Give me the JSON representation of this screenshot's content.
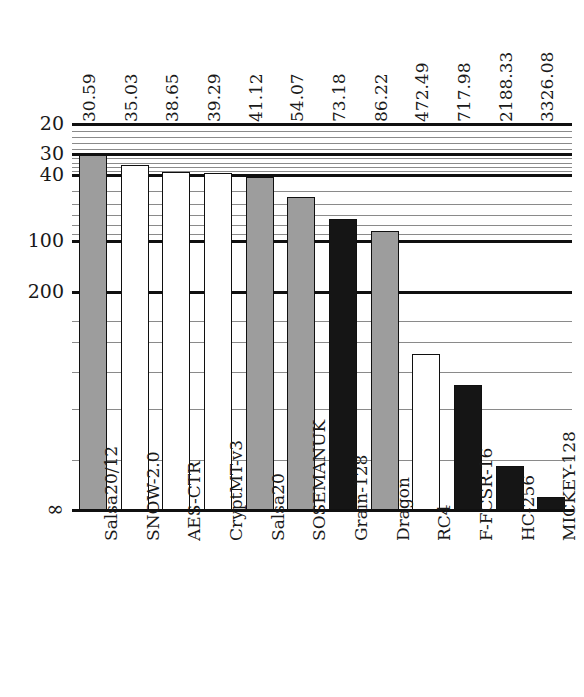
{
  "chart_data": {
    "type": "bar",
    "title": "",
    "subtitle": "",
    "xlabel": "",
    "ylabel": "",
    "categories": [
      "Salsa20/12",
      "SNOW-2.0",
      "AES-CTR",
      "CryptMT-v3",
      "Salsa20",
      "SOSEMANUK",
      "Grain-128",
      "Dragon",
      "RC4",
      "F-FCSR-16",
      "HC-256",
      "MICKEY-128"
    ],
    "values": [
      30.59,
      35.03,
      38.65,
      39.29,
      41.12,
      54.07,
      73.18,
      86.22,
      472.49,
      717.98,
      2188.33,
      3326.08
    ],
    "value_labels": [
      "30.59",
      "35.03",
      "38.65",
      "39.29",
      "41.12",
      "54.07",
      "73.18",
      "86.22",
      "472.49",
      "717.98",
      "2188.33",
      "3326.08"
    ],
    "bar_fills": [
      "gray",
      "white",
      "white",
      "white",
      "gray",
      "gray",
      "black",
      "gray",
      "white",
      "black",
      "black",
      "black"
    ],
    "scale": "log-inverted",
    "axis_direction": "values increase downward",
    "ylim": [
      20,
      4000
    ],
    "y_tick_labels": [
      "20",
      "30",
      "40",
      "100",
      "200",
      "∞"
    ],
    "y_tick_values": [
      20,
      30,
      40,
      100,
      200,
      4000
    ],
    "y_minor_tick_values": [
      22,
      24,
      26,
      28,
      32,
      34,
      36,
      38,
      50,
      60,
      70,
      80,
      90,
      300,
      400,
      600,
      1000,
      2000
    ],
    "grid": true,
    "legend": null,
    "colors": {
      "bar_gray": "#9d9d9d",
      "bar_white": "#ffffff",
      "bar_black": "#151515",
      "outline": "#101010",
      "gridline_minor": "#8a8a8a",
      "gridline_major": "#101010",
      "background": "#ffffff"
    }
  }
}
